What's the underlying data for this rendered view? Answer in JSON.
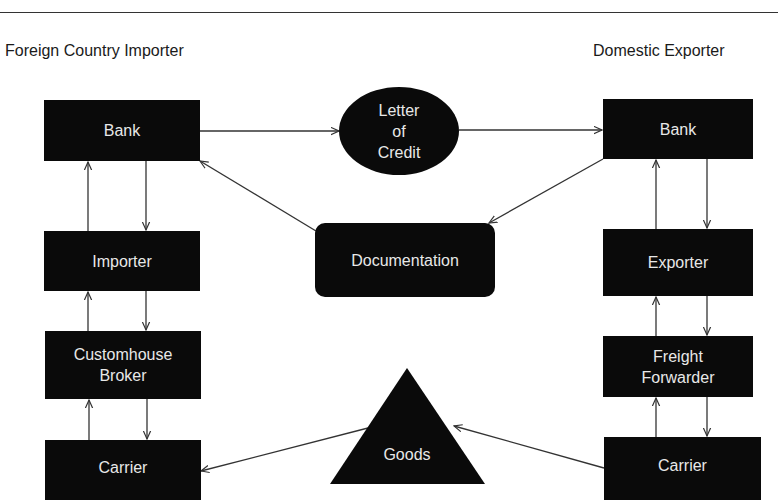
{
  "headings": {
    "left": "Foreign Country  Importer",
    "right": "Domestic Exporter"
  },
  "left_column": {
    "bank": "Bank",
    "importer": "Importer",
    "customhouse_broker": [
      "Customhouse",
      "Broker"
    ],
    "carrier": "Carrier"
  },
  "right_column": {
    "bank": "Bank",
    "exporter": "Exporter",
    "freight_forwarder": [
      "Freight",
      "Forwarder"
    ],
    "carrier": "Carrier"
  },
  "center": {
    "letter_of_credit": [
      "Letter",
      "of",
      "Credit"
    ],
    "documentation": "Documentation",
    "goods": "Goods"
  },
  "colors": {
    "node_fill": "#0a0a0a",
    "node_text": "#e8e8e8",
    "line": "#333333",
    "background": "#ffffff"
  },
  "edges": [
    {
      "from": "Foreign Bank",
      "to": "Letter of Credit"
    },
    {
      "from": "Letter of Credit",
      "to": "Domestic Bank"
    },
    {
      "from": "Domestic Bank",
      "to": "Documentation"
    },
    {
      "from": "Documentation",
      "to": "Foreign Bank"
    },
    {
      "from": "Foreign Bank",
      "to": "Importer"
    },
    {
      "from": "Importer",
      "to": "Foreign Bank"
    },
    {
      "from": "Importer",
      "to": "Customhouse Broker"
    },
    {
      "from": "Customhouse Broker",
      "to": "Importer"
    },
    {
      "from": "Customhouse Broker",
      "to": "Foreign Carrier"
    },
    {
      "from": "Foreign Carrier",
      "to": "Customhouse Broker"
    },
    {
      "from": "Goods",
      "to": "Foreign Carrier"
    },
    {
      "from": "Domestic Carrier",
      "to": "Goods"
    },
    {
      "from": "Domestic Bank",
      "to": "Exporter"
    },
    {
      "from": "Exporter",
      "to": "Domestic Bank"
    },
    {
      "from": "Exporter",
      "to": "Freight Forwarder"
    },
    {
      "from": "Freight Forwarder",
      "to": "Exporter"
    },
    {
      "from": "Freight Forwarder",
      "to": "Domestic Carrier"
    },
    {
      "from": "Domestic Carrier",
      "to": "Freight Forwarder"
    }
  ]
}
